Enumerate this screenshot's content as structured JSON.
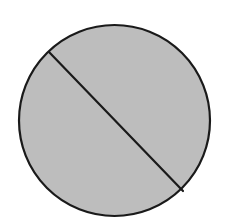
{
  "diagram": {
    "type": "circle-with-chord",
    "background": "#ffffff",
    "circle": {
      "cx": 114.5,
      "cy": 120.5,
      "r": 95.5,
      "fill": "#bdbdbd",
      "stroke": "#1a1a1a",
      "stroke_width": 2.2
    },
    "chord": {
      "x1": 49,
      "y1": 52,
      "x2": 183,
      "y2": 191,
      "stroke": "#1a1a1a",
      "stroke_width": 2.2
    }
  }
}
